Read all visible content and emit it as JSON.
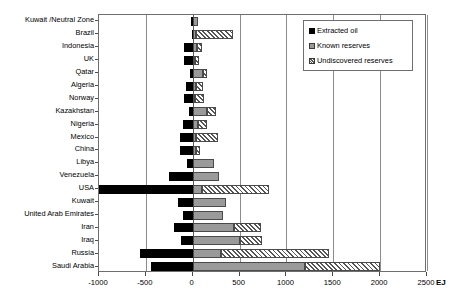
{
  "chart_data": {
    "type": "bar",
    "orientation": "horizontal",
    "stacked": true,
    "title": "",
    "xlabel": "EJ",
    "ylabel": "",
    "xlim": [
      -1000,
      2500
    ],
    "xticks": [
      -1000,
      -500,
      0,
      500,
      1000,
      1500,
      2000,
      2500
    ],
    "xtick_labels": [
      "-1000",
      "-500",
      "0",
      "500",
      "1000",
      "1500",
      "2000",
      "2500"
    ],
    "grid": true,
    "legend_position": "top-right",
    "unit": "EJ",
    "categories": [
      "Kuwait /Neutral Zone",
      "Brazil",
      "Indonesia",
      "UK",
      "Qatar",
      "Algeria",
      "Norway",
      "Kazakhstan",
      "Nigeria",
      "Mexico",
      "China",
      "Libya",
      "Venezuela",
      "USA",
      "Kuwait",
      "United Arab Emirates",
      "Iran",
      "Iraq",
      "Russia",
      "Saudi Arabia"
    ],
    "series": [
      {
        "name": "Extracted oil",
        "color": "#000000",
        "values": [
          -20,
          -10,
          -90,
          -95,
          -25,
          -70,
          -90,
          -35,
          -105,
          -135,
          -135,
          -60,
          -250,
          -1000,
          -160,
          -105,
          -200,
          -125,
          -560,
          -450
        ]
      },
      {
        "name": "Known reserves",
        "color": "#9a9a9a",
        "values": [
          55,
          40,
          50,
          25,
          105,
          30,
          25,
          155,
          55,
          35,
          35,
          225,
          280,
          100,
          360,
          325,
          440,
          500,
          300,
          1200
        ]
      },
      {
        "name": "Undiscovered reserves",
        "color": "#ffffff",
        "hatch": "diagonal",
        "values": [
          0,
          390,
          45,
          45,
          45,
          75,
          95,
          95,
          100,
          230,
          40,
          0,
          0,
          710,
          0,
          0,
          290,
          240,
          1150,
          800
        ]
      }
    ]
  },
  "legend": {
    "items": [
      {
        "label": "Extracted oil",
        "swatch": "extracted-oil-swatch"
      },
      {
        "label": "Known reserves",
        "swatch": "known-reserves-swatch"
      },
      {
        "label": "Undiscovered reserves",
        "swatch": "undiscovered-reserves-swatch"
      }
    ]
  }
}
